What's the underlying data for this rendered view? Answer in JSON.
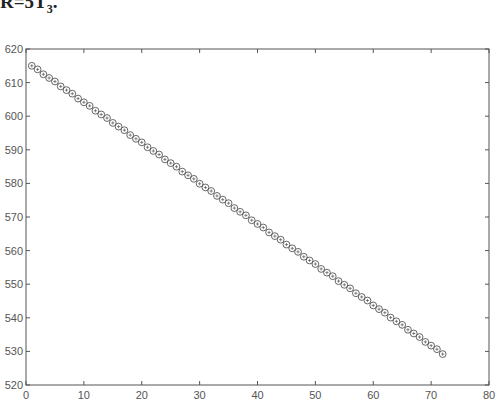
{
  "caption": {
    "main": "R=5T",
    "sub": "3",
    "tail": "."
  },
  "chart_data": {
    "type": "scatter",
    "title": "",
    "xlabel": "",
    "ylabel": "",
    "xlim": [
      0,
      80
    ],
    "ylim": [
      520,
      620
    ],
    "xticks": [
      0,
      10,
      20,
      30,
      40,
      50,
      60,
      70,
      80
    ],
    "yticks": [
      520,
      530,
      540,
      550,
      560,
      570,
      580,
      590,
      600,
      610,
      620
    ],
    "grid": false,
    "legend": null,
    "marker": "circle with plus",
    "series": [
      {
        "name": "R",
        "x_start": 1,
        "x_end": 72,
        "y_start": 615.0,
        "y_end": 529.3,
        "note": "72 points, approximately linear decrease (~1.21 per step)"
      }
    ]
  },
  "colors": {
    "axis": "#555555",
    "marker": "#555555",
    "background": "#ffffff"
  }
}
